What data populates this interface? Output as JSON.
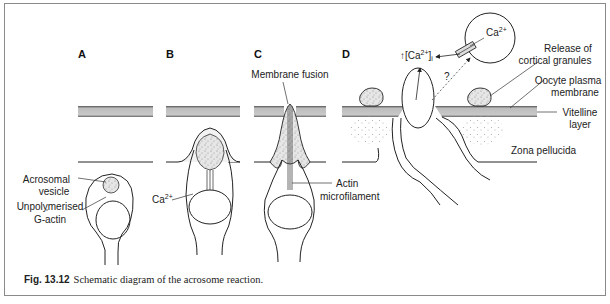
{
  "figure": {
    "panels": [
      "A",
      "B",
      "C",
      "D"
    ],
    "labels": {
      "acrosomal_vesicle_1": "Acrosomal",
      "acrosomal_vesicle_2": "vesicle",
      "g_actin_1": "Unpolymerised",
      "g_actin_2": "G-actin",
      "ca_b": "Ca",
      "ca_b_sup": "2+",
      "membrane_fusion": "Membrane fusion",
      "actin_1": "Actin",
      "actin_2": "microfilament",
      "ca_i_arrow": "↑",
      "ca_i_open": "[Ca",
      "ca_i_sup": "2+",
      "ca_i_close": "]",
      "ca_i_sub": "i",
      "ca_store": "Ca",
      "ca_store_sup": "2+",
      "question": "?",
      "cortical_1": "Release of",
      "cortical_2": "cortical granules",
      "oocyte_1": "Oocyte plasma",
      "oocyte_2": "membrane",
      "vitelline_1": "Vitelline",
      "vitelline_2": "layer",
      "zona": "Zona pellucida"
    },
    "caption": {
      "number": "Fig. 13.12",
      "text": "Schematic diagram of the acrosome reaction."
    }
  }
}
